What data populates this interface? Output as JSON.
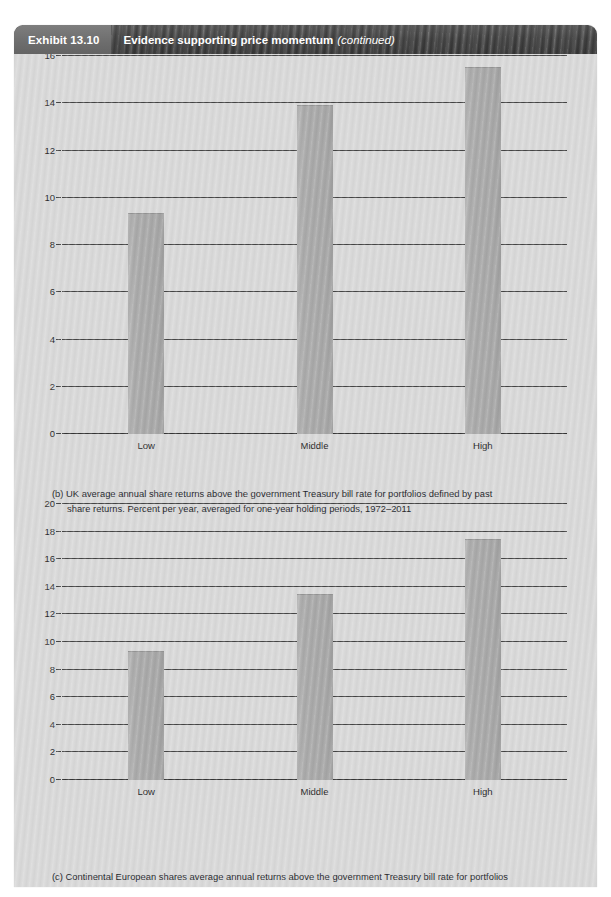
{
  "exhibit": {
    "tag": "Exhibit 13.10",
    "title": "Evidence supporting price momentum",
    "continued": "(continued)"
  },
  "colors": {
    "panel_background": "#d5d5d5",
    "title_bar": "#373737",
    "exhibit_tag": "#6d6d6d",
    "bar_fill": "#a6a6a6",
    "gridline": "#3c3c3c",
    "text": "#14161b"
  },
  "captions": {
    "b_line1": "(b) UK average annual share returns above the government Treasury bill rate for portfolios defined by past",
    "b_line2": "share returns.  Percent per year, averaged for one-year holding periods, 1972–2011",
    "c_line1": "(c) Continental European shares average annual returns above the government Treasury bill rate for portfolios",
    "c_line2": "defined by past share returns.  Percent per year, averaged for one-year holding periods, 1974–2011"
  },
  "chart_data": [
    {
      "id": "b",
      "type": "bar",
      "title": "(b) UK average annual share returns above the government Treasury bill rate for portfolios defined by past share returns.  Percent per year, averaged for one-year holding periods, 1972–2011",
      "xlabel": "",
      "ylabel": "",
      "categories": [
        "Low",
        "Middle",
        "High"
      ],
      "values": [
        9.3,
        13.9,
        15.5
      ],
      "ylim": [
        0,
        16
      ],
      "yticks": [
        0,
        2,
        4,
        6,
        8,
        10,
        12,
        14,
        16
      ],
      "ytick_labels": [
        "0",
        "2",
        "4",
        "6",
        "8",
        "10",
        "12",
        "14",
        "16"
      ],
      "grid": true,
      "legend": "none"
    },
    {
      "id": "c",
      "type": "bar",
      "title": "(c) Continental European shares average annual returns above the government Treasury bill rate for portfolios defined by past share returns.  Percent per year, averaged for one-year holding periods, 1974–2011",
      "xlabel": "",
      "ylabel": "",
      "categories": [
        "Low",
        "Middle",
        "High"
      ],
      "values": [
        9.25,
        13.4,
        17.4
      ],
      "ylim": [
        0,
        20
      ],
      "yticks": [
        0,
        2,
        4,
        6,
        8,
        10,
        12,
        14,
        16,
        18,
        20
      ],
      "ytick_labels": [
        "0",
        "2",
        "4",
        "6",
        "8",
        "10",
        "12",
        "14",
        "16",
        "18",
        "20"
      ],
      "grid": true,
      "legend": "none"
    }
  ]
}
